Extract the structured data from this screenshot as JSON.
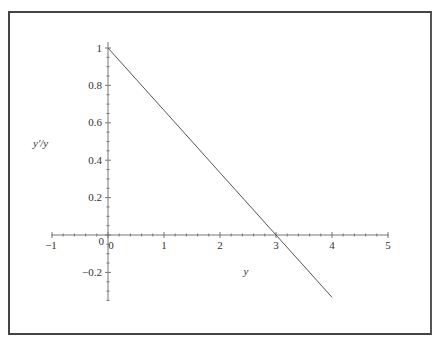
{
  "chart_data": {
    "type": "line",
    "title": "",
    "xlabel": "y",
    "ylabel": "y'/y",
    "xlim": [
      -1,
      5
    ],
    "ylim": [
      -0.35,
      1
    ],
    "grid": false,
    "legend": null,
    "x_ticks": [
      "-1",
      "0",
      "1",
      "2",
      "3",
      "4",
      "5"
    ],
    "y_ticks": [
      "-0.2",
      "0",
      "0.2",
      "0.4",
      "0.6",
      "0.8",
      "1"
    ],
    "series": [
      {
        "name": "y'/y = 1 - y/3",
        "color": "#555555",
        "x": [
          0,
          1,
          2,
          3,
          4
        ],
        "y": [
          1.0,
          0.667,
          0.333,
          0.0,
          -0.333
        ]
      }
    ]
  },
  "labels": {
    "xlabel": "y",
    "ylabel": "y'/y",
    "x_ticks": [
      "−1",
      "0",
      "1",
      "2",
      "3",
      "4",
      "5"
    ],
    "y_ticks": [
      "−0.2",
      "0",
      "0.2",
      "0.4",
      "0.6",
      "0.8",
      "1"
    ]
  }
}
